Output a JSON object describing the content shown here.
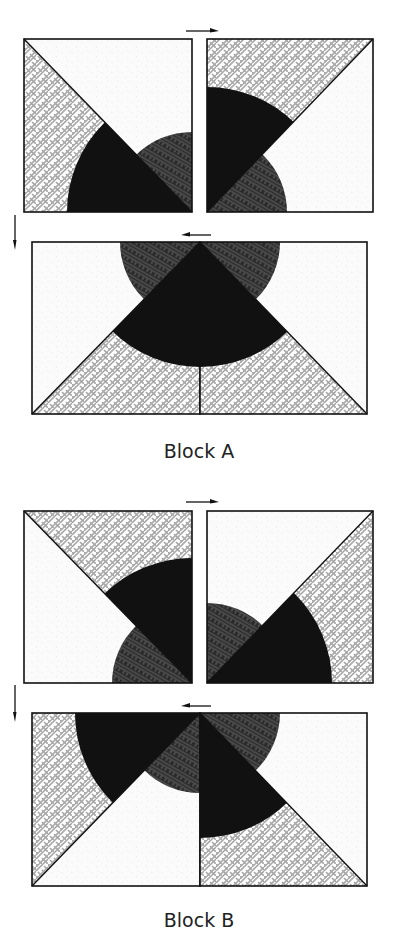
{
  "colors": {
    "black": "#111111",
    "dark_pattern_bg": "#2a2a2a",
    "dark_pattern_line": "#6a6a6a",
    "weave_bg": "#ffffff",
    "weave_line": "#a8a8a8",
    "white_fabric": "#fbfbfb",
    "outline": "#111111"
  },
  "radii": {
    "large": 125,
    "small": 80
  },
  "blocks": [
    {
      "label": "Block A",
      "label_y": 440,
      "arrows": [
        {
          "dir": "right",
          "x1": 186,
          "x2": 219,
          "y": 31
        },
        {
          "dir": "down",
          "x": 15,
          "y1": 215,
          "y2": 250
        },
        {
          "dir": "left",
          "x1": 181,
          "x2": 211,
          "y": 235
        }
      ],
      "units": [
        {
          "x": 24,
          "y": 39,
          "w": 168,
          "h": 173,
          "center": "br",
          "diag": "tl-br",
          "tri_a": "weave",
          "tri_b": "white",
          "big_side": "a",
          "big": "black",
          "small": "dark"
        },
        {
          "x": 207,
          "y": 39,
          "w": 166,
          "h": 173,
          "center": "bl",
          "diag": "bl-tr",
          "tri_a": "weave",
          "tri_b": "white",
          "big_side": "a",
          "big": "black",
          "small": "dark"
        },
        {
          "x": 32,
          "y": 242,
          "w": 168,
          "h": 172,
          "center": "tr",
          "diag": "bl-tr",
          "tri_a": "white",
          "tri_b": "weave",
          "big_side": "b",
          "big": "black",
          "small": "dark"
        },
        {
          "x": 200,
          "y": 242,
          "w": 167,
          "h": 172,
          "center": "tl",
          "diag": "tl-br",
          "tri_a": "weave",
          "tri_b": "white",
          "big_side": "a",
          "big": "black",
          "small": "dark"
        }
      ]
    },
    {
      "label": "Block B",
      "label_y": 909,
      "arrows": [
        {
          "dir": "right",
          "x1": 186,
          "x2": 219,
          "y": 502
        },
        {
          "dir": "down",
          "x": 15,
          "y1": 685,
          "y2": 722
        },
        {
          "dir": "left",
          "x1": 181,
          "x2": 211,
          "y": 706
        }
      ],
      "units": [
        {
          "x": 24,
          "y": 511,
          "w": 168,
          "h": 172,
          "center": "br",
          "diag": "tl-br",
          "tri_a": "white",
          "tri_b": "weave",
          "big_side": "b",
          "big": "black",
          "small": "dark"
        },
        {
          "x": 207,
          "y": 511,
          "w": 166,
          "h": 172,
          "center": "bl",
          "diag": "bl-tr",
          "tri_a": "white",
          "tri_b": "weave",
          "big_side": "b",
          "big": "black",
          "small": "dark"
        },
        {
          "x": 32,
          "y": 713,
          "w": 168,
          "h": 173,
          "center": "tr",
          "diag": "bl-tr",
          "tri_a": "weave",
          "tri_b": "white",
          "big_side": "a",
          "big": "black",
          "small": "dark"
        },
        {
          "x": 200,
          "y": 713,
          "w": 167,
          "h": 173,
          "center": "tl",
          "diag": "tl-br",
          "tri_a": "weave",
          "tri_b": "white",
          "big_side": "a",
          "big": "black",
          "small": "dark"
        }
      ]
    }
  ]
}
